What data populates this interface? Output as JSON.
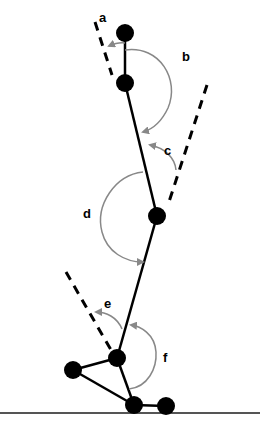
{
  "diagram": {
    "colors": {
      "segment": "#000000",
      "dashed": "#000000",
      "arc": "#888888",
      "ground": "#555555",
      "joint": "#000000"
    },
    "joints": [
      {
        "id": "head",
        "x": 125,
        "y": 33
      },
      {
        "id": "neck",
        "x": 125,
        "y": 83
      },
      {
        "id": "hip",
        "x": 157,
        "y": 216
      },
      {
        "id": "ankle",
        "x": 117,
        "y": 358
      },
      {
        "id": "heel",
        "x": 73,
        "y": 370
      },
      {
        "id": "toe-base",
        "x": 134,
        "y": 405
      },
      {
        "id": "toe-tip",
        "x": 166,
        "y": 406
      }
    ],
    "labels": {
      "a": "a",
      "b": "b",
      "c": "c",
      "d": "d",
      "e": "e",
      "f": "f"
    }
  }
}
